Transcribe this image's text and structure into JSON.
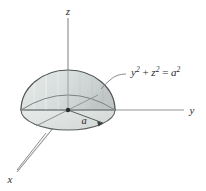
{
  "figure": {
    "type": "3d-hemisphere-diagram",
    "background_color": "#ffffff",
    "axes": {
      "z_label": "z",
      "y_label": "y",
      "x_label": "x"
    },
    "annotations": {
      "radius_label": "a",
      "equation_y": "y",
      "equation_y_exp": "2",
      "equation_plus": " + ",
      "equation_z": "z",
      "equation_z_exp": "2",
      "equation_equals": " = ",
      "equation_a": "a",
      "equation_a_exp": "2",
      "equation_full": "y² + z² = a²"
    },
    "colors": {
      "surface_fill": "#d9dedd",
      "surface_fill_light": "#e7ebea",
      "surface_fill_dark": "#c3cac9",
      "outline": "#4d5352",
      "axis_line": "#8c9291",
      "text": "#2b2b2b",
      "leader_line": "#777d7c"
    },
    "geometry": {
      "origin_x": 68,
      "origin_y": 110,
      "radius_x": 47,
      "radius_y": 14,
      "dome_height": 40
    }
  }
}
